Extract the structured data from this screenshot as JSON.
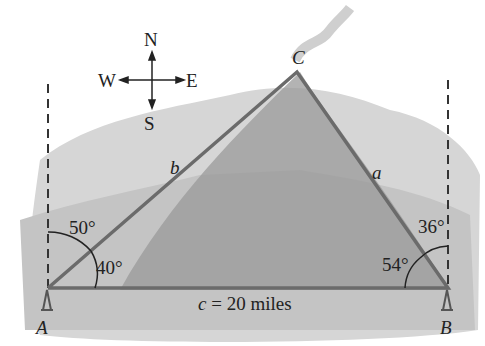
{
  "compass": {
    "north": "N",
    "south": "S",
    "east": "E",
    "west": "W"
  },
  "vertices": {
    "A": "A",
    "B": "B",
    "C": "C"
  },
  "sides": {
    "a": "a",
    "b": "b",
    "c_label": "c",
    "c_value": "= 20 miles"
  },
  "angles": {
    "A_from_north": "50°",
    "A_interior": "40°",
    "B_from_north": "36°",
    "B_interior": "54°"
  },
  "colors": {
    "triangle_line": "#6b6b6b",
    "terrain": "#bdbdbd",
    "dark_terrain": "#8f8f8f"
  }
}
